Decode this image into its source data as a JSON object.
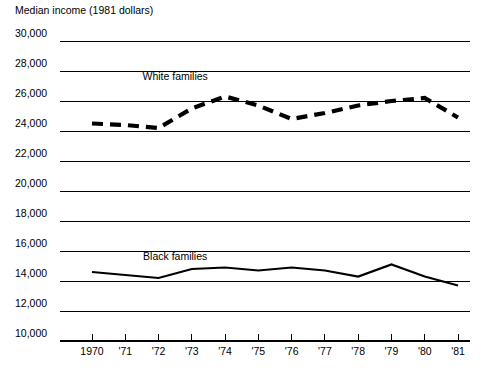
{
  "chart_data": {
    "type": "line",
    "title": "Median income (1981 dollars)",
    "xlabel": "",
    "ylabel": "",
    "ylim": [
      10000,
      30000
    ],
    "ytick_step": 2000,
    "ytick_labels": [
      "30,000",
      "28,000",
      "26,000",
      "24,000",
      "22,000",
      "20,000",
      "18,000",
      "16,000",
      "14,000",
      "12,000",
      "10,000"
    ],
    "ytick_values": [
      30000,
      28000,
      26000,
      24000,
      22000,
      20000,
      18000,
      16000,
      14000,
      12000,
      10000
    ],
    "grid": true,
    "legend_position": "inline-labels",
    "categories": [
      "1970",
      "'71",
      "'72",
      "'73",
      "'74",
      "'75",
      "'76",
      "'77",
      "'78",
      "'79",
      "'80",
      "'81"
    ],
    "x": [
      1970,
      1971,
      1972,
      1973,
      1974,
      1975,
      1976,
      1977,
      1978,
      1979,
      1980,
      1981
    ],
    "series": [
      {
        "name": "White families",
        "style": "dashed",
        "label_x": 1972.5,
        "label_y": 27400,
        "values": [
          24500,
          24400,
          24200,
          25500,
          26300,
          25700,
          24800,
          25200,
          25700,
          26000,
          26200,
          24900
        ]
      },
      {
        "name": "Black families",
        "style": "solid",
        "label_x": 1972.5,
        "label_y": 15400,
        "values": [
          14600,
          14400,
          14200,
          14800,
          14900,
          14700,
          14900,
          14700,
          14300,
          15100,
          14300,
          13700
        ]
      }
    ],
    "series_values_note": "Values read from gridline positions in the source plot"
  },
  "colors": {
    "ink": "#000000",
    "background": "#ffffff",
    "gridline": "#000000"
  },
  "geometry": {
    "plot_left": 92,
    "plot_right": 458,
    "plot_top": 41,
    "plot_bottom": 341,
    "grid_x_start": 60,
    "grid_x_end": 470,
    "title_x": 15,
    "title_y": 14
  }
}
